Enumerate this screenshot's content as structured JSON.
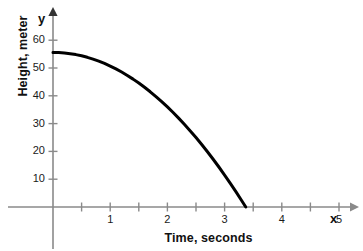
{
  "chart_data": {
    "type": "line",
    "title": "",
    "xlabel": "Time, seconds",
    "ylabel": "Height, meter",
    "x_axis_name": "x",
    "y_axis_name": "y",
    "xlim": [
      0,
      5.15
    ],
    "ylim": [
      0,
      64
    ],
    "grid": false,
    "legend": "none",
    "x_ticks": [
      {
        "value": 0.5,
        "label": ""
      },
      {
        "value": 1,
        "label": "1"
      },
      {
        "value": 1.5,
        "label": ""
      },
      {
        "value": 2,
        "label": "2"
      },
      {
        "value": 2.5,
        "label": ""
      },
      {
        "value": 3,
        "label": "3"
      },
      {
        "value": 3.5,
        "label": ""
      },
      {
        "value": 4,
        "label": "4"
      },
      {
        "value": 4.5,
        "label": ""
      },
      {
        "value": 5,
        "label": "5"
      }
    ],
    "x_tick_labels": [
      "1",
      "2",
      "3",
      "4",
      "5"
    ],
    "y_ticks": [
      {
        "value": 10,
        "label": "10"
      },
      {
        "value": 20,
        "label": "20"
      },
      {
        "value": 30,
        "label": "30"
      },
      {
        "value": 40,
        "label": "40"
      },
      {
        "value": 50,
        "label": "50"
      },
      {
        "value": 60,
        "label": "60"
      }
    ],
    "y_tick_labels": [
      "10",
      "20",
      "30",
      "40",
      "50",
      "60"
    ],
    "series": [
      {
        "name": "height",
        "color": "#000000",
        "line_width": 3,
        "x": [
          0,
          0.1,
          0.2,
          0.3,
          0.4,
          0.5,
          0.6,
          0.7,
          0.8,
          0.9,
          1.0,
          1.1,
          1.2,
          1.3,
          1.4,
          1.5,
          1.6,
          1.7,
          1.8,
          1.9,
          2.0,
          2.1,
          2.2,
          2.3,
          2.4,
          2.5,
          2.6,
          2.7,
          2.8,
          2.9,
          3.0,
          3.1,
          3.2,
          3.3,
          3.37
        ],
        "y": [
          55.6,
          55.55,
          55.4,
          55.16,
          54.82,
          54.38,
          53.84,
          53.2,
          52.46,
          51.63,
          50.7,
          49.67,
          48.54,
          47.32,
          46.0,
          44.58,
          43.06,
          41.44,
          39.73,
          37.92,
          36.0,
          33.99,
          31.88,
          29.68,
          27.38,
          24.98,
          22.48,
          19.88,
          17.18,
          14.39,
          11.5,
          8.51,
          5.42,
          2.24,
          0.0
        ]
      }
    ],
    "annotations": {
      "start_height": "55.6",
      "landing_time": "3.37"
    },
    "axis_color": "#8a8a8a",
    "curve_color": "#000000",
    "text_color": "#111111"
  },
  "geometry": {
    "origin_x": 53,
    "origin_y": 207,
    "px_per_x_unit": 57.2,
    "px_per_y_unit": 2.78,
    "x_axis_end": 350,
    "y_axis_top": 16
  }
}
